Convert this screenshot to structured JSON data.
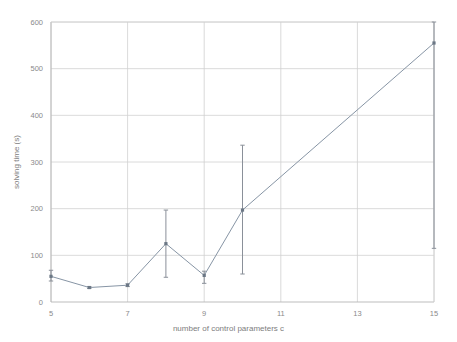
{
  "chart_data": {
    "type": "line",
    "title": "",
    "subtitle": "",
    "xlabel": "number of control parameters c",
    "ylabel": "solving  time (s)",
    "xlim": [
      5,
      15
    ],
    "ylim": [
      0,
      600
    ],
    "grid": true,
    "legend": null,
    "legend_position": "none",
    "x_ticks": [
      5,
      7,
      9,
      11,
      13,
      15
    ],
    "x_tick_labels": [
      "5",
      "7",
      "9",
      "11",
      "13",
      "15"
    ],
    "y_ticks": [
      0,
      100,
      200,
      300,
      400,
      500,
      600
    ],
    "y_tick_labels": [
      "0",
      "100",
      "200",
      "300",
      "400",
      "500",
      "600"
    ],
    "x": [
      5,
      6,
      7,
      8,
      9,
      10,
      15
    ],
    "values": [
      55,
      31,
      36,
      125,
      57,
      197,
      555
    ],
    "error_low": [
      45,
      29,
      33,
      53,
      40,
      60,
      115
    ],
    "error_high": [
      68,
      33,
      39,
      197,
      66,
      336,
      603
    ],
    "series": [
      {
        "name": "solving time",
        "x": [
          5,
          6,
          7,
          8,
          9,
          10,
          15
        ],
        "values": [
          55,
          31,
          36,
          125,
          57,
          197,
          555
        ],
        "error_low": [
          45,
          29,
          33,
          53,
          40,
          60,
          115
        ],
        "error_high": [
          68,
          33,
          39,
          197,
          66,
          336,
          603
        ],
        "color": "#8795a5",
        "marker": "square"
      }
    ],
    "colors": {
      "line": "#8795a5",
      "marker": "#6b7785",
      "errorbar": "#8a9099",
      "grid": "#d0d0d0",
      "axis": "#b5b5b5",
      "text": "#8a8a8a",
      "background": "#ffffff"
    }
  }
}
